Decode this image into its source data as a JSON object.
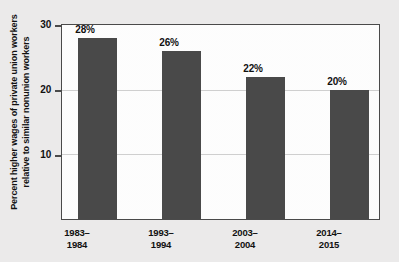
{
  "chart_data": {
    "type": "bar",
    "title": "",
    "subtitle": "",
    "xlabel": "",
    "ylabel_line1": "Percent higher wages of private union workers",
    "ylabel_line2": "relative to similar nonunion workers",
    "categories": [
      "1983–\n1984",
      "1993–\n1994",
      "2003–\n2004",
      "2014–\n2015"
    ],
    "category_lines": [
      [
        "1983–",
        "1984"
      ],
      [
        "1993–",
        "1994"
      ],
      [
        "2003–",
        "2004"
      ],
      [
        "2014–",
        "2015"
      ]
    ],
    "values": [
      28,
      26,
      22,
      20
    ],
    "value_labels": [
      "28%",
      "26%",
      "22%",
      "20%"
    ],
    "ylim": [
      0,
      30
    ],
    "yticks": [
      10,
      20,
      30
    ],
    "ytick_labels": [
      "10",
      "20",
      "30"
    ],
    "grid": true,
    "gridlines_at": [
      10,
      20
    ],
    "legend": null,
    "legend_position": "none",
    "bar_color": "#494949",
    "plot_background": "#fdfdfd",
    "page_background": "#ebeaea",
    "frame_color": "#4a4a4a",
    "grid_color": "#cfcfcf",
    "text_color": "#111111"
  }
}
